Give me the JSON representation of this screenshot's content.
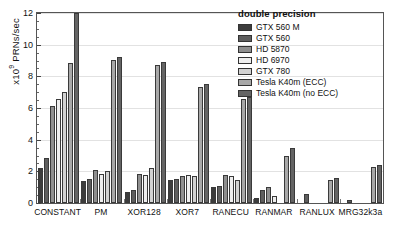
{
  "chart_data": {
    "type": "bar",
    "title": "",
    "xlabel": "",
    "ylabel": "x10⁹ PRNs/sec",
    "ylim": [
      0,
      12
    ],
    "yticks": [
      0,
      2,
      4,
      6,
      8,
      10,
      12
    ],
    "ytick_labels": [
      "0",
      "2",
      "4",
      "6",
      "8",
      "10",
      "12"
    ],
    "grid": true,
    "legend_position": "top-right",
    "legend_title": "double precision",
    "categories": [
      "CONSTANT",
      "PM",
      "XOR128",
      "XOR7",
      "RANECU",
      "RANMAR",
      "RANLUX",
      "MRG32k3a"
    ],
    "series": [
      {
        "name": "GTX 560 M",
        "color": "#3c3c3c",
        "values": [
          2.2,
          1.4,
          0.7,
          1.45,
          1.0,
          0.3,
          0.0,
          0.0
        ]
      },
      {
        "name": "GTX 560",
        "color": "#5e5e5e",
        "values": [
          2.85,
          1.5,
          0.85,
          1.5,
          1.1,
          0.85,
          0.55,
          0.2
        ]
      },
      {
        "name": "HD 5870",
        "color": "#8f8f8f",
        "values": [
          6.1,
          2.1,
          1.85,
          1.7,
          1.8,
          1.0,
          0.0,
          0.0
        ]
      },
      {
        "name": "HD 6970",
        "color": "#efefef",
        "values": [
          6.6,
          1.85,
          1.8,
          1.75,
          1.7,
          0.45,
          0.0,
          0.0
        ]
      },
      {
        "name": "GTX 780",
        "color": "#d2d2d2",
        "values": [
          7.0,
          2.0,
          2.2,
          1.7,
          1.45,
          0.0,
          0.0,
          0.0
        ]
      },
      {
        "name": "Tesla K40m (ECC)",
        "color": "#a8a8a8",
        "values": [
          8.85,
          9.05,
          8.7,
          7.35,
          6.55,
          3.0,
          1.45,
          2.3
        ]
      },
      {
        "name": "Tesla K40m (no ECC)",
        "color": "#646464",
        "values": [
          12.0,
          9.2,
          8.9,
          7.5,
          6.7,
          3.45,
          1.55,
          2.4
        ]
      }
    ]
  }
}
